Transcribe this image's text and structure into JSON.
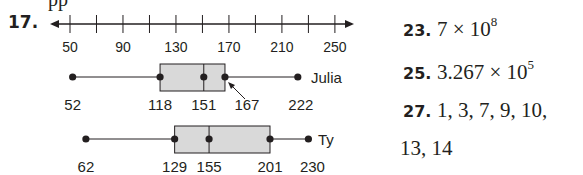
{
  "top_partial_text": "pp",
  "problem17": {
    "number": "17.",
    "axis": {
      "ticks": [
        50,
        70,
        90,
        110,
        130,
        150,
        170,
        190,
        210,
        230,
        250
      ],
      "labels": [
        "50",
        "90",
        "130",
        "170",
        "210",
        "250"
      ]
    },
    "plots": [
      {
        "name": "Julia",
        "min": "52",
        "q1": "118",
        "median": "151",
        "q3": "167",
        "max": "222"
      },
      {
        "name": "Ty",
        "min": "62",
        "q1": "129",
        "median": "155",
        "q3": "201",
        "max": "230"
      }
    ]
  },
  "answers": [
    {
      "number": "23.",
      "text": "7 × 10",
      "exp": "8"
    },
    {
      "number": "25.",
      "text": "3.267 × 10",
      "exp": "5"
    },
    {
      "number": "27.",
      "text": "1, 3, 7, 9, 10,",
      "exp": ""
    },
    {
      "number": "",
      "text": "13, 14",
      "exp": ""
    }
  ],
  "chart_data": {
    "type": "boxplot",
    "title": "",
    "xlabel": "",
    "ylabel": "",
    "xlim": [
      50,
      250
    ],
    "x_ticks": [
      50,
      70,
      90,
      110,
      130,
      150,
      170,
      190,
      210,
      230,
      250
    ],
    "x_tick_labels": [
      "50",
      "90",
      "130",
      "170",
      "210",
      "250"
    ],
    "series": [
      {
        "name": "Julia",
        "min": 52,
        "q1": 118,
        "median": 151,
        "q3": 167,
        "max": 222
      },
      {
        "name": "Ty",
        "min": 62,
        "q1": 129,
        "median": 155,
        "q3": 201,
        "max": 230
      }
    ],
    "grid": false,
    "annotations": [
      "Arrow pointing to Julia's Q3 value 167"
    ]
  }
}
